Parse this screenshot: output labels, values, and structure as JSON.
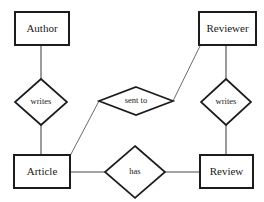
{
  "diagram": {
    "background_color": "#ffffff",
    "stroke_color": "#1c1c1c",
    "connector_color": "#4a4a4a",
    "text_color": "#1a1a1a",
    "entities": [
      {
        "id": "author",
        "label": "Author",
        "x": 15,
        "y": 12,
        "w": 54,
        "h": 33
      },
      {
        "id": "reviewer",
        "label": "Reviewer",
        "x": 199,
        "y": 12,
        "w": 57,
        "h": 33
      },
      {
        "id": "article",
        "label": "Article",
        "x": 14,
        "y": 155,
        "w": 56,
        "h": 33
      },
      {
        "id": "review",
        "label": "Review",
        "x": 200,
        "y": 155,
        "w": 53,
        "h": 33
      }
    ],
    "relationships": [
      {
        "id": "writes-left",
        "label": "writes",
        "cx": 41,
        "cy": 102,
        "rx": 26,
        "ry": 23
      },
      {
        "id": "sent-to",
        "label": "sent to",
        "cx": 136,
        "cy": 101,
        "rx": 37,
        "ry": 14
      },
      {
        "id": "writes-right",
        "label": "writes",
        "cx": 226,
        "cy": 102,
        "rx": 25,
        "ry": 23
      },
      {
        "id": "has",
        "label": "has",
        "cx": 135,
        "cy": 172,
        "rx": 30,
        "ry": 26
      }
    ],
    "connections": [
      {
        "id": "author-writes",
        "from": "author",
        "to": "writes-left",
        "kind": "vertical"
      },
      {
        "id": "writes-article",
        "from": "writes-left",
        "to": "article",
        "kind": "vertical"
      },
      {
        "id": "reviewer-writes",
        "from": "reviewer",
        "to": "writes-right",
        "kind": "vertical"
      },
      {
        "id": "writes-review",
        "from": "writes-right",
        "to": "review",
        "kind": "vertical"
      },
      {
        "id": "article-sent-to",
        "from": "article",
        "to": "sent-to",
        "kind": "diagonal"
      },
      {
        "id": "sent-to-reviewer",
        "from": "sent-to",
        "to": "reviewer",
        "kind": "diagonal"
      },
      {
        "id": "article-has",
        "from": "article",
        "to": "has",
        "kind": "horizontal"
      },
      {
        "id": "has-review",
        "from": "has",
        "to": "review",
        "kind": "horizontal"
      }
    ]
  }
}
